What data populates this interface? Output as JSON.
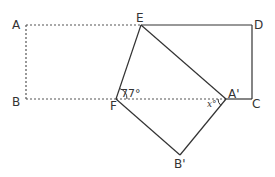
{
  "diagram": {
    "colors": {
      "line": "#333333",
      "dotted": "#555555",
      "background": "#ffffff"
    },
    "points": {
      "A": {
        "label": "A"
      },
      "B": {
        "label": "B"
      },
      "C": {
        "label": "C"
      },
      "D": {
        "label": "D"
      },
      "E": {
        "label": "E"
      },
      "F": {
        "label": "F"
      },
      "A_prime": {
        "label": "A'"
      },
      "B_prime": {
        "label": "B'"
      }
    },
    "angles": {
      "at_F": "77°",
      "at_A_prime": "x°"
    },
    "segments_solid": [
      "E-D",
      "D-C",
      "C-A'",
      "E-F",
      "E-A'",
      "F-B'",
      "B'-A'"
    ],
    "segments_dotted": [
      "A-E",
      "A-B",
      "B-F",
      "F-A'"
    ]
  }
}
